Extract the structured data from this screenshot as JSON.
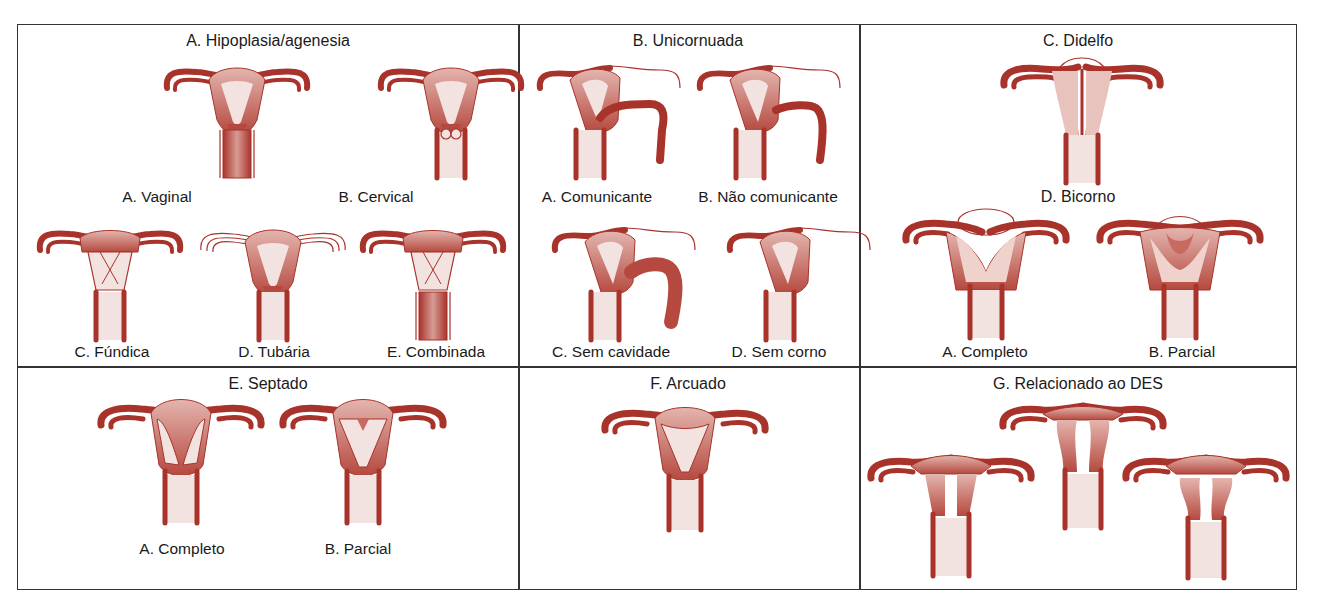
{
  "colors": {
    "wall": "#a8332b",
    "body_fill": "#cf8c83",
    "cavity": "#f3e3e0",
    "border": "#333333"
  },
  "panels": {
    "a": {
      "title": "A.  Hipoplasia/agenesia",
      "items": [
        {
          "label": "A. Vaginal"
        },
        {
          "label": "B. Cervical"
        },
        {
          "label": "C. Fúndica"
        },
        {
          "label": "D. Tubária"
        },
        {
          "label": "E. Combinada"
        }
      ]
    },
    "b": {
      "title": "B.  Unicornuada",
      "items": [
        {
          "label": "A. Comunicante"
        },
        {
          "label": "B. Não comunicante"
        },
        {
          "label": "C. Sem cavidade"
        },
        {
          "label": "D. Sem corno"
        }
      ]
    },
    "c": {
      "title": "C.  Didelfo"
    },
    "d": {
      "title": "D. Bicorno",
      "items": [
        {
          "label": "A. Completo"
        },
        {
          "label": "B. Parcial"
        }
      ]
    },
    "e": {
      "title": "E.  Septado",
      "items": [
        {
          "label": "A. Completo"
        },
        {
          "label": "B. Parcial"
        }
      ]
    },
    "f": {
      "title": "F.  Arcuado"
    },
    "g": {
      "title": "G.  Relacionado ao DES"
    }
  }
}
